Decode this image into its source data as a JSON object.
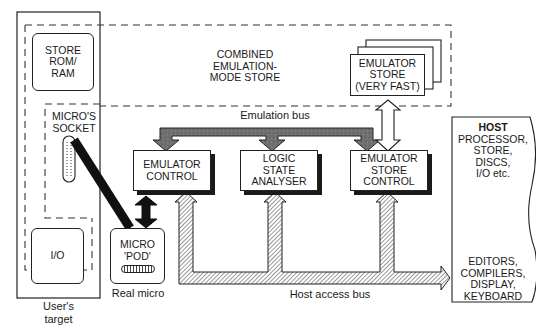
{
  "diagram": {
    "users_target": {
      "caption_line1": "User's",
      "caption_line2": "target",
      "store_rom_ram": [
        "STORE",
        "ROM/",
        "RAM"
      ],
      "micros_socket": [
        "MICRO'S",
        "SOCKET"
      ],
      "io": "I/O"
    },
    "combined_store": {
      "label": [
        "COMBINED",
        "EMULATION-",
        "MODE STORE"
      ]
    },
    "emulator_store": {
      "label": [
        "EMULATOR",
        "STORE",
        "(VERY FAST)"
      ]
    },
    "emulation_bus": {
      "label": "Emulation bus",
      "color": "#6b6b6b"
    },
    "emulator_control": {
      "label": [
        "EMULATOR",
        "CONTROL"
      ]
    },
    "logic_state_analyser": {
      "label": [
        "LOGIC",
        "STATE",
        "ANALYSER"
      ]
    },
    "emulator_store_control": {
      "label": [
        "EMULATOR",
        "STORE",
        "CONTROL"
      ]
    },
    "micro_pod": {
      "label": [
        "MICRO",
        "'POD'"
      ],
      "caption": "Real micro"
    },
    "host_access_bus": {
      "label": "Host access bus"
    },
    "host": {
      "title": "HOST",
      "upper": [
        "PROCESSOR,",
        "STORE,",
        "DISCS,",
        "I/O etc."
      ],
      "lower": [
        "EDITORS,",
        "COMPILERS,",
        "DISPLAY,",
        "KEYBOARD"
      ]
    }
  }
}
